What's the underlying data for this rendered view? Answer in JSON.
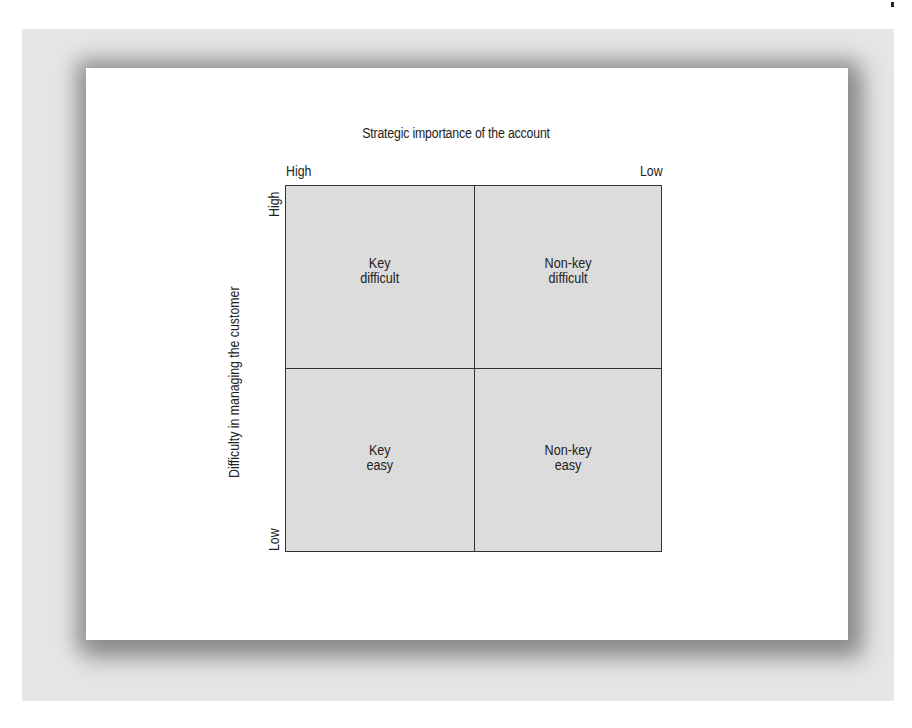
{
  "diagram": {
    "title": "Strategic importance of the account",
    "x_axis": {
      "left_label": "High",
      "right_label": "Low"
    },
    "y_axis": {
      "title": "Difficulty in managing the customer",
      "top_label": "High",
      "bottom_label": "Low"
    },
    "quadrants": [
      {
        "position": "top-left",
        "line1": "Key",
        "line2": "difficult"
      },
      {
        "position": "top-right",
        "line1": "Non-key",
        "line2": "difficult"
      },
      {
        "position": "bottom-left",
        "line1": "Key",
        "line2": "easy"
      },
      {
        "position": "bottom-right",
        "line1": "Non-key",
        "line2": "easy"
      }
    ],
    "colors": {
      "quadrant_fill": "#dcdcdc",
      "grid_line": "#333333",
      "backdrop": "#e6e6e6"
    }
  }
}
